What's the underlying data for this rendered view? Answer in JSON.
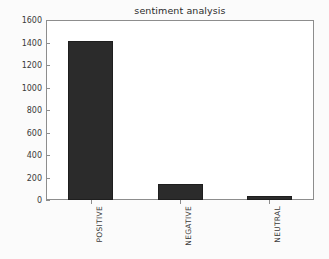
{
  "chart_data": {
    "type": "bar",
    "title": "sentiment analysis",
    "xlabel": "",
    "ylabel": "",
    "categories": [
      "POSITIVE",
      "NEGATIVE",
      "NEUTRAL"
    ],
    "values": [
      1410,
      140,
      35
    ],
    "ylim": [
      0,
      1600
    ],
    "yticks": [
      0,
      200,
      400,
      600,
      800,
      1000,
      1200,
      1400,
      1600
    ],
    "ytick_labels": [
      "0",
      "200",
      "400",
      "600",
      "800",
      "1000",
      "1200",
      "1400",
      "1600"
    ],
    "grid": false,
    "legend": false,
    "bar_color": "#2b2b2b",
    "frame_color": "#8d8d8d",
    "background_color": "#ffffff",
    "xtick_rotation": 90
  }
}
